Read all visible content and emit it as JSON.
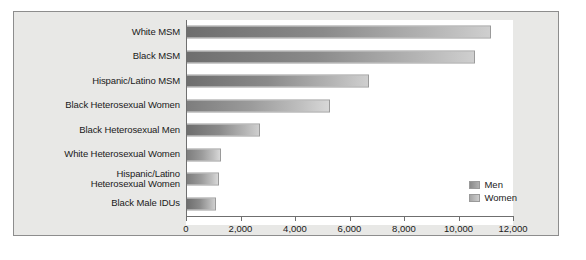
{
  "chart_data": {
    "type": "bar",
    "orientation": "horizontal",
    "title": "",
    "xlabel": "",
    "ylabel": "",
    "xlim": [
      0,
      12000
    ],
    "grid": false,
    "legend_position": "bottom-right",
    "categories": [
      "White MSM",
      "Black MSM",
      "Hispanic/Latino MSM",
      "Black Heterosexual Women",
      "Black Heterosexual Men",
      "White Heterosexual Women",
      "Hispanic/Latino\nHeterosexual Women",
      "Black Male IDUs"
    ],
    "values": [
      11200,
      10600,
      6700,
      5300,
      2700,
      1300,
      1200,
      1100
    ],
    "series_of": [
      "Men",
      "Men",
      "Men",
      "Women",
      "Men",
      "Women",
      "Women",
      "Men"
    ],
    "tick_labels": [
      "0",
      "2,000",
      "4,000",
      "6,000",
      "8,000",
      "10,000",
      "12,000"
    ],
    "tick_values": [
      0,
      2000,
      4000,
      6000,
      8000,
      10000,
      12000
    ],
    "legend": [
      {
        "label": "Men",
        "key": "men"
      },
      {
        "label": "Women",
        "key": "women"
      }
    ],
    "colors": {
      "men_dark": "#6e6e6e",
      "men_light": "#cfcfcf",
      "women_dark": "#7d7d7d",
      "women_light": "#d8d8d8",
      "panel_background": "#e8e8e6",
      "plot_background": "#ffffff",
      "axis": "#6f6f6f"
    }
  }
}
